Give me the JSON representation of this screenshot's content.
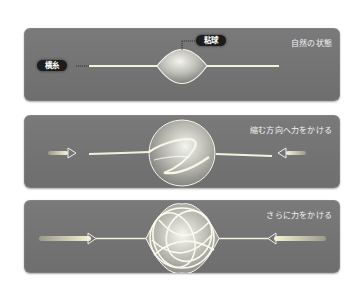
{
  "panels": [
    {
      "caption": "自然の状態",
      "labels": {
        "thread": "横糸",
        "glue": "粘球"
      },
      "state": "natural"
    },
    {
      "caption": "縮む方向へ力をかける",
      "state": "compressed",
      "arrows": [
        "right-arrow",
        "left-arrow"
      ]
    },
    {
      "caption": "さらに力をかける",
      "state": "more-compressed",
      "arrows": [
        "right-arrow",
        "left-arrow"
      ]
    }
  ],
  "colors": {
    "panel_bg": "#747474",
    "thread": "#f0f0e0",
    "tag_bg": "#1c1c1c",
    "caption": "#f2f2f2"
  }
}
